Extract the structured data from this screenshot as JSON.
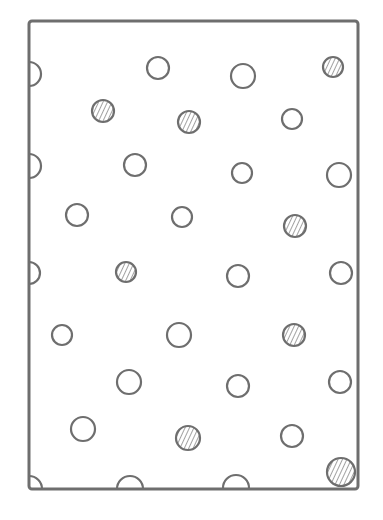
{
  "diagram": {
    "title": "",
    "stroke_color": "#6e6e6e",
    "fill_color": "#ffffff",
    "hatch_color": "#8a8a8a",
    "frame": {
      "x1": 29,
      "y1": 21,
      "x2": 358,
      "y2": 489
    },
    "circles": [
      {
        "cx": 29,
        "cy": 74,
        "r": 12,
        "hatched": false,
        "clip": "left"
      },
      {
        "cx": 158,
        "cy": 68,
        "r": 11,
        "hatched": false
      },
      {
        "cx": 243,
        "cy": 76,
        "r": 12,
        "hatched": false
      },
      {
        "cx": 333,
        "cy": 67,
        "r": 10,
        "hatched": true
      },
      {
        "cx": 103,
        "cy": 111,
        "r": 11,
        "hatched": true
      },
      {
        "cx": 189,
        "cy": 122,
        "r": 11,
        "hatched": true
      },
      {
        "cx": 292,
        "cy": 119,
        "r": 10,
        "hatched": false
      },
      {
        "cx": 29,
        "cy": 166,
        "r": 12,
        "hatched": false,
        "clip": "left"
      },
      {
        "cx": 135,
        "cy": 165,
        "r": 11,
        "hatched": false
      },
      {
        "cx": 242,
        "cy": 173,
        "r": 10,
        "hatched": false
      },
      {
        "cx": 339,
        "cy": 175,
        "r": 12,
        "hatched": false
      },
      {
        "cx": 77,
        "cy": 215,
        "r": 11,
        "hatched": false
      },
      {
        "cx": 182,
        "cy": 217,
        "r": 10,
        "hatched": false
      },
      {
        "cx": 295,
        "cy": 226,
        "r": 11,
        "hatched": true
      },
      {
        "cx": 29,
        "cy": 273,
        "r": 11,
        "hatched": false,
        "clip": "left"
      },
      {
        "cx": 126,
        "cy": 272,
        "r": 10,
        "hatched": true
      },
      {
        "cx": 238,
        "cy": 276,
        "r": 11,
        "hatched": false
      },
      {
        "cx": 341,
        "cy": 273,
        "r": 11,
        "hatched": false
      },
      {
        "cx": 62,
        "cy": 335,
        "r": 10,
        "hatched": false
      },
      {
        "cx": 179,
        "cy": 335,
        "r": 12,
        "hatched": false
      },
      {
        "cx": 294,
        "cy": 335,
        "r": 11,
        "hatched": true
      },
      {
        "cx": 129,
        "cy": 382,
        "r": 12,
        "hatched": false
      },
      {
        "cx": 238,
        "cy": 386,
        "r": 11,
        "hatched": false
      },
      {
        "cx": 340,
        "cy": 382,
        "r": 11,
        "hatched": false
      },
      {
        "cx": 83,
        "cy": 429,
        "r": 12,
        "hatched": false
      },
      {
        "cx": 188,
        "cy": 438,
        "r": 12,
        "hatched": true
      },
      {
        "cx": 292,
        "cy": 436,
        "r": 11,
        "hatched": false
      },
      {
        "cx": 29,
        "cy": 489,
        "r": 13,
        "hatched": false,
        "clip": "corner"
      },
      {
        "cx": 130,
        "cy": 489,
        "r": 13,
        "hatched": false,
        "clip": "bottom"
      },
      {
        "cx": 236,
        "cy": 488,
        "r": 13,
        "hatched": false,
        "clip": "bottom"
      },
      {
        "cx": 341,
        "cy": 472,
        "r": 14,
        "hatched": true
      }
    ],
    "counts": {
      "total": 31,
      "hatched": 9,
      "open": 22
    }
  }
}
